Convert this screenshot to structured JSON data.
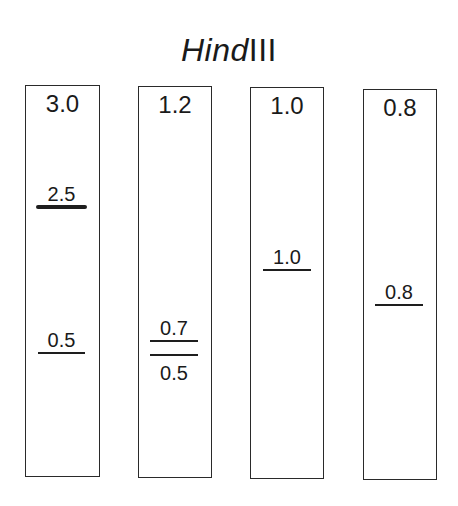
{
  "title": {
    "italic_part": "Hind",
    "roman_part": "III"
  },
  "lanes": [
    {
      "label": "3.0",
      "box": {
        "left": 25,
        "top": 85,
        "width": 75,
        "height": 392
      },
      "bands": [
        {
          "label": "2.5",
          "y": 207,
          "x1": 36,
          "x2": 87,
          "thick": true,
          "label_pos": "above"
        },
        {
          "label": "0.5",
          "y": 353,
          "x1": 38,
          "x2": 85,
          "thick": false,
          "label_pos": "above"
        }
      ]
    },
    {
      "label": "1.2",
      "box": {
        "left": 138,
        "top": 86,
        "width": 74,
        "height": 392
      },
      "bands": [
        {
          "label": "0.7",
          "y": 341,
          "x1": 150,
          "x2": 198,
          "thick": false,
          "label_pos": "above"
        },
        {
          "label": "0.5",
          "y": 355,
          "x1": 150,
          "x2": 198,
          "thick": false,
          "label_pos": "below"
        }
      ]
    },
    {
      "label": "1.0",
      "box": {
        "left": 250,
        "top": 87,
        "width": 74,
        "height": 392
      },
      "bands": [
        {
          "label": "1.0",
          "y": 270,
          "x1": 263,
          "x2": 311,
          "thick": false,
          "label_pos": "above"
        }
      ]
    },
    {
      "label": "0.8",
      "box": {
        "left": 363,
        "top": 89,
        "width": 74,
        "height": 391
      },
      "bands": [
        {
          "label": "0.8",
          "y": 305,
          "x1": 375,
          "x2": 423,
          "thick": false,
          "label_pos": "above"
        }
      ]
    }
  ],
  "colors": {
    "ink": "#1e1e1e",
    "background": "#ffffff"
  }
}
